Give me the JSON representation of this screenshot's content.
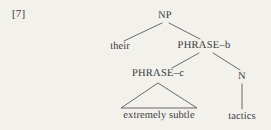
{
  "figure": {
    "example_number": "[7]",
    "caption": "",
    "background_color": "#f2f1ec",
    "line_color": "#5a5a5a",
    "text_color": "#3a3a3a"
  },
  "tree": {
    "type": "syntax-tree",
    "nodes": [
      {
        "id": "np",
        "label": "NP",
        "kind": "category",
        "x": 165,
        "y": 16
      },
      {
        "id": "their",
        "label": "their",
        "kind": "terminal",
        "x": 120,
        "y": 47
      },
      {
        "id": "phrase-b",
        "label": "PHRASE–b",
        "kind": "category",
        "x": 204,
        "y": 46
      },
      {
        "id": "phrase-c",
        "label": "PHRASE–c",
        "kind": "category",
        "x": 158,
        "y": 74
      },
      {
        "id": "n",
        "label": "N",
        "kind": "category",
        "x": 242,
        "y": 77
      },
      {
        "id": "extremely-subtle",
        "label": "extremely subtle",
        "kind": "terminal",
        "x": 159,
        "y": 116
      },
      {
        "id": "tactics",
        "label": "tactics",
        "kind": "terminal",
        "x": 242,
        "y": 117
      }
    ],
    "edges": [
      {
        "from": "np",
        "to": "their",
        "style": "line"
      },
      {
        "from": "np",
        "to": "phrase-b",
        "style": "line"
      },
      {
        "from": "phrase-b",
        "to": "phrase-c",
        "style": "line"
      },
      {
        "from": "phrase-b",
        "to": "n",
        "style": "line"
      },
      {
        "from": "phrase-c",
        "to": "extremely-subtle",
        "style": "triangle"
      },
      {
        "from": "n",
        "to": "tactics",
        "style": "line"
      }
    ],
    "line_segments": [
      {
        "name": "np-to-their",
        "x1": 162,
        "y1": 23,
        "x2": 124,
        "y2": 41
      },
      {
        "name": "np-to-phrase-b",
        "x1": 169,
        "y1": 23,
        "x2": 200,
        "y2": 39
      },
      {
        "name": "phrase-b-to-phrase-c",
        "x1": 199,
        "y1": 53,
        "x2": 172,
        "y2": 68
      },
      {
        "name": "phrase-b-to-n",
        "x1": 213,
        "y1": 53,
        "x2": 240,
        "y2": 70
      },
      {
        "name": "n-to-tactics",
        "x1": 242,
        "y1": 84,
        "x2": 242,
        "y2": 109
      }
    ],
    "triangle": {
      "name": "phrase-c-triangle",
      "apex_x": 158,
      "apex_y": 83,
      "left_x": 121,
      "left_y": 108,
      "right_x": 197,
      "right_y": 108
    }
  }
}
